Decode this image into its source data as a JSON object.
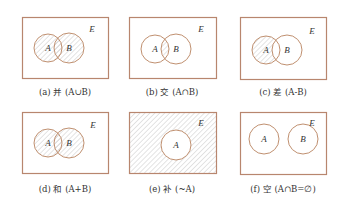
{
  "figure": {
    "colors": {
      "box_stroke": "#b8866e",
      "circle_stroke": "#c09070",
      "hatch": "#c8c8c8",
      "background": "#ffffff",
      "text": "#333333"
    },
    "universe_label": "E",
    "panels": [
      {
        "id": "a",
        "caption": "(a) 并 (A∪B)",
        "box": [
          22,
          17,
          86,
          61
        ],
        "circles": [
          {
            "label": "A",
            "cx": 48,
            "cy": 48,
            "r": 14
          },
          {
            "label": "B",
            "cx": 69,
            "cy": 48,
            "r": 15
          }
        ],
        "shade": "union",
        "e_pos": [
          92,
          32
        ],
        "caption_pos": [
          65,
          92
        ]
      },
      {
        "id": "b",
        "caption": "(b) 交 (A∩B)",
        "box": [
          129,
          17,
          87,
          61
        ],
        "circles": [
          {
            "label": "A",
            "cx": 155,
            "cy": 49,
            "r": 14
          },
          {
            "label": "B",
            "cx": 176,
            "cy": 49,
            "r": 15
          }
        ],
        "shade": "intersection",
        "e_pos": [
          201,
          32
        ],
        "caption_pos": [
          172,
          92
        ]
      },
      {
        "id": "c",
        "caption": "(c) 差 (A-B)",
        "box": [
          240,
          17,
          86,
          62
        ],
        "circles": [
          {
            "label": "A",
            "cx": 266,
            "cy": 50,
            "r": 14
          },
          {
            "label": "B",
            "cx": 287,
            "cy": 50,
            "r": 15
          }
        ],
        "shade": "difference",
        "e_pos": [
          312,
          34
        ],
        "caption_pos": [
          283,
          92
        ]
      },
      {
        "id": "d",
        "caption": "(d) 和 (A+B)",
        "box": [
          22,
          112,
          86,
          61
        ],
        "circles": [
          {
            "label": "A",
            "cx": 48,
            "cy": 143,
            "r": 14
          },
          {
            "label": "B",
            "cx": 69,
            "cy": 143,
            "r": 15
          }
        ],
        "shade": "union",
        "e_pos": [
          93,
          128
        ],
        "caption_pos": [
          65,
          189
        ]
      },
      {
        "id": "e",
        "caption": "(e) 补 (~A)",
        "box": [
          129,
          112,
          87,
          61
        ],
        "circles": [
          {
            "label": "A",
            "cx": 176,
            "cy": 145,
            "r": 15
          }
        ],
        "shade": "complement",
        "e_pos": [
          201,
          126
        ],
        "caption_pos": [
          172,
          189
        ]
      },
      {
        "id": "f",
        "caption": "(f) 空 (A∩B=∅)",
        "box": [
          240,
          112,
          86,
          62
        ],
        "circles": [
          {
            "label": "A",
            "cx": 264,
            "cy": 139,
            "r": 15
          },
          {
            "label": "B",
            "cx": 303,
            "cy": 139,
            "r": 15
          }
        ],
        "shade": "none",
        "e_pos": [
          312,
          126
        ],
        "caption_pos": [
          283,
          189
        ]
      }
    ]
  }
}
